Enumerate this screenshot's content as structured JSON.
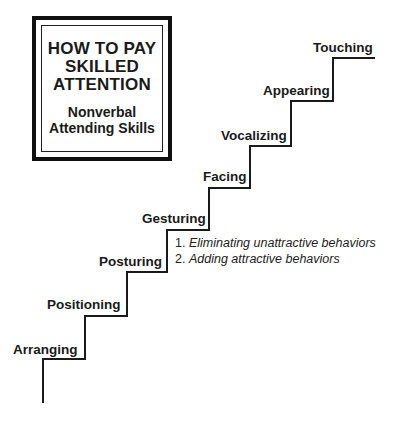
{
  "title_box": {
    "title_lines": [
      "HOW TO PAY",
      "SKILLED",
      "ATTENTION"
    ],
    "subtitle_lines": [
      "Nonverbal",
      "Attending Skills"
    ]
  },
  "steps": [
    {
      "label": "Arranging"
    },
    {
      "label": "Positioning"
    },
    {
      "label": "Posturing"
    },
    {
      "label": "Gesturing"
    },
    {
      "label": "Facing"
    },
    {
      "label": "Vocalizing"
    },
    {
      "label": "Appearing"
    },
    {
      "label": "Touching"
    }
  ],
  "gesturing_notes": [
    {
      "number": "1.",
      "text": "Eliminating unattractive behaviors"
    },
    {
      "number": "2.",
      "text": "Adding attractive behaviors"
    }
  ],
  "colors": {
    "line": "#1a1a1a",
    "background": "#ffffff"
  }
}
